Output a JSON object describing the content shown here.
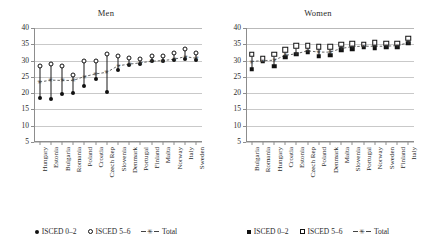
{
  "chart_data": [
    {
      "type": "scatter",
      "title": "Men",
      "xlabel": "",
      "ylabel": "",
      "ylim": [
        5,
        40
      ],
      "yticks": [
        5,
        10,
        15,
        20,
        25,
        30,
        35,
        40
      ],
      "grid": true,
      "legend_position": "bottom",
      "categories": [
        "Hungary",
        "Estonia",
        "Bulgaria",
        "Romania",
        "Poland",
        "Croatia",
        "Czech Rep",
        "Slovenia",
        "Denmark",
        "Portugal",
        "Finland",
        "Malta",
        "Norway",
        "Italy",
        "Sweden"
      ],
      "series": [
        {
          "name": "ISCED 0-2",
          "marker": "filled-circle",
          "values": [
            18.6,
            18.1,
            19.6,
            20.2,
            22.3,
            24.3,
            20.3,
            27.1,
            28.7,
            29.1,
            29.9,
            30.0,
            30.3,
            30.5,
            30.3
          ]
        },
        {
          "name": "ISCED 5-6",
          "marker": "open-circle",
          "values": [
            28.2,
            29.0,
            28.2,
            25.7,
            29.8,
            29.8,
            32.0,
            31.3,
            30.7,
            30.6,
            31.4,
            31.4,
            32.3,
            33.7,
            32.4
          ]
        },
        {
          "name": "Total",
          "marker": "star-dashed",
          "values": [
            23.4,
            24.0,
            23.9,
            23.9,
            25.1,
            25.9,
            26.4,
            28.4,
            28.9,
            29.3,
            29.8,
            30.0,
            30.4,
            31.2,
            30.7
          ]
        }
      ]
    },
    {
      "type": "scatter",
      "title": "Women",
      "xlabel": "",
      "ylabel": "",
      "ylim": [
        5,
        40
      ],
      "yticks": [
        5,
        10,
        15,
        20,
        25,
        30,
        35,
        40
      ],
      "grid": true,
      "legend_position": "bottom",
      "categories": [
        "Bulgaria",
        "Romania",
        "Hungary",
        "Croatia",
        "Estonia",
        "Czech Rep",
        "Poland",
        "Denmark",
        "Malta",
        "Slovenia",
        "Portugal",
        "Norway",
        "Sweden",
        "Finland",
        "Italy"
      ],
      "series": [
        {
          "name": "ISCED 0-2",
          "marker": "filled-square",
          "values": [
            27.4,
            29.8,
            28.3,
            31.1,
            32.0,
            32.6,
            31.3,
            31.6,
            33.3,
            33.6,
            34.2,
            34.0,
            34.1,
            34.3,
            35.3
          ]
        },
        {
          "name": "ISCED 5-6",
          "marker": "open-square",
          "values": [
            32.0,
            30.6,
            32.0,
            33.3,
            34.6,
            34.6,
            34.3,
            34.2,
            35.0,
            35.2,
            35.0,
            35.5,
            35.3,
            35.3,
            36.9
          ]
        },
        {
          "name": "Total",
          "marker": "star-dashed",
          "values": [
            29.7,
            30.0,
            30.1,
            31.6,
            32.1,
            33.0,
            32.6,
            32.6,
            33.7,
            34.3,
            34.4,
            34.4,
            34.4,
            34.6,
            35.5
          ]
        }
      ]
    }
  ],
  "panels": [
    {
      "title": "Men",
      "legend": [
        {
          "label": "ISCED 0–2",
          "mark": "filled-circle"
        },
        {
          "label": "ISCED 5–6",
          "mark": "open-circle"
        },
        {
          "label": "Total",
          "mark": "star-dashed"
        }
      ]
    },
    {
      "title": "Women",
      "legend": [
        {
          "label": "ISCED 0–2",
          "mark": "filled-square"
        },
        {
          "label": "ISCED 5–6",
          "mark": "open-square"
        },
        {
          "label": "Total",
          "mark": "star-dashed"
        }
      ]
    }
  ]
}
